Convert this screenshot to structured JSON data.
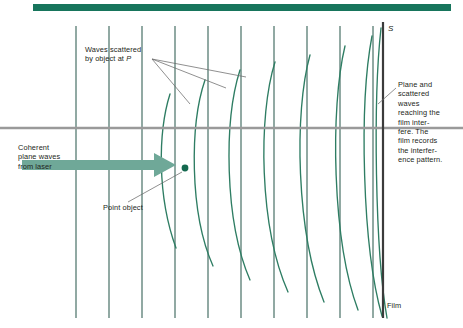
{
  "figure": {
    "type": "holography-recording-diagram",
    "top_rule_color": "#17755c",
    "wavefront_color": "#2e7d63",
    "film_color": "#3b3b3b",
    "axis_line_color": "#9a9a9a",
    "arrow_color": "#6fa898",
    "leader_color": "#6b6b6b",
    "point_marker_color": "#14694f"
  },
  "labels": {
    "waves_scattered": "Waves scattered\nby object at P",
    "waves_scattered_line1": "Waves scattered",
    "waves_scattered_line2_pre": "by object at ",
    "waves_scattered_point": "P",
    "plane_scattered": "Plane and\nscattered\nwaves\nreaching the\nfilm inter-\nfere. The\nfilm records\nthe interfer-\nence pattern.",
    "coherent_source": "Coherent\nplane waves\nfrom laser",
    "point_object": "Point object",
    "film": "Film",
    "source_axis": "S"
  },
  "geometry": {
    "top_rule": {
      "x": 33,
      "y": 4,
      "width": 418,
      "height": 7
    },
    "horizontal_axis": {
      "y": 128,
      "x_start": 0,
      "x_end": 463
    },
    "film_line": {
      "x": 383,
      "y_top": 22,
      "y_bottom": 318
    },
    "point_object": {
      "x": 185,
      "y": 168,
      "radius": 3.4
    },
    "plane_wave_lines_x": [
      76,
      109,
      142,
      175,
      208,
      241,
      274,
      307,
      340,
      373
    ],
    "plane_wave_y_top": 26,
    "plane_wave_y_bottom": 318,
    "arrow": {
      "x_start": 22,
      "x_end": 176,
      "y": 165,
      "shaft_height": 11,
      "head_width": 22,
      "head_height": 24
    },
    "scattered_arc_count": 8,
    "scattered_arcs": [
      {
        "top_x": 170,
        "mid_x": 163,
        "bottom_x": 176,
        "y_top": 94,
        "y_bottom": 248,
        "bulge": -16
      },
      {
        "top_x": 205,
        "mid_x": 196,
        "bottom_x": 213,
        "y_top": 80,
        "y_bottom": 266,
        "bulge": -18
      },
      {
        "top_x": 240,
        "mid_x": 230,
        "bottom_x": 250,
        "y_top": 70,
        "y_bottom": 280,
        "bulge": -19
      },
      {
        "top_x": 275,
        "mid_x": 265,
        "bottom_x": 288,
        "y_top": 62,
        "y_bottom": 292,
        "bulge": -19
      },
      {
        "top_x": 310,
        "mid_x": 300,
        "bottom_x": 324,
        "y_top": 55,
        "y_bottom": 302,
        "bulge": -18
      },
      {
        "top_x": 345,
        "mid_x": 336,
        "bottom_x": 358,
        "y_top": 46,
        "y_bottom": 310,
        "bulge": -16
      },
      {
        "top_x": 372,
        "mid_x": 364,
        "bottom_x": 382,
        "y_top": 36,
        "y_bottom": 316,
        "bulge": -13
      },
      {
        "top_x": 381,
        "mid_x": 375,
        "bottom_x": 387,
        "y_top": 28,
        "y_bottom": 318,
        "bulge": -9
      }
    ],
    "leaders": [
      {
        "x1": 152,
        "y1": 59,
        "x2": 190,
        "y2": 104
      },
      {
        "x1": 152,
        "y1": 59,
        "x2": 226,
        "y2": 88
      },
      {
        "x1": 152,
        "y1": 59,
        "x2": 246,
        "y2": 77
      }
    ],
    "leader_point_object": {
      "x1": 128,
      "y1": 202,
      "x2": 182,
      "y2": 172
    },
    "leader_plane_scattered": {
      "x1": 396,
      "y1": 88,
      "x2": 378,
      "y2": 104
    }
  }
}
